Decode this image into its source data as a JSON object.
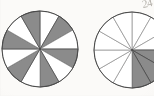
{
  "page": {
    "kind": "scanned-worksheet-fragment",
    "background_color": "#fbfaf8",
    "width": 154,
    "height": 96,
    "annotation_text": "24"
  },
  "palette": {
    "shaded_fill": "#8b8b8b",
    "unshaded_fill": "#ffffff",
    "stroke": "#4a4a4a",
    "light_stroke": "#8d8d8d",
    "paper": "#fbfaf8",
    "pencil": "#9a968f"
  },
  "chart_data": [
    {
      "type": "pie",
      "name": "left-fraction-circle",
      "title": "",
      "center_x": 40,
      "center_y": 49,
      "radius": 38,
      "slice_count": 12,
      "start_angle_deg": -90,
      "equal_slices": true,
      "slice_value": 1,
      "categories": [
        "1",
        "2",
        "3",
        "4",
        "5",
        "6",
        "7",
        "8",
        "9",
        "10",
        "11",
        "12"
      ],
      "values": [
        1,
        1,
        1,
        1,
        1,
        1,
        1,
        1,
        1,
        1,
        1,
        1
      ],
      "shaded": [
        false,
        true,
        false,
        true,
        false,
        true,
        false,
        true,
        false,
        true,
        false,
        true
      ],
      "shaded_count": 6,
      "total_count": 12,
      "fraction_label": "6/12",
      "legend": []
    },
    {
      "type": "pie",
      "name": "right-fraction-circle",
      "title": "",
      "center_x": 132,
      "center_y": 50,
      "radius": 38,
      "slice_count": 12,
      "start_angle_deg": -90,
      "equal_slices": true,
      "slice_value": 1,
      "categories": [
        "1",
        "2",
        "3",
        "4",
        "5",
        "6",
        "7",
        "8",
        "9",
        "10",
        "11",
        "12"
      ],
      "values": [
        1,
        1,
        1,
        1,
        1,
        1,
        1,
        1,
        1,
        1,
        1,
        1
      ],
      "shaded": [
        false,
        false,
        false,
        true,
        true,
        true,
        false,
        false,
        false,
        false,
        false,
        false
      ],
      "shaded_count": 3,
      "total_count": 12,
      "fraction_label": "3/12",
      "clipped_at_right_edge": true,
      "legend": []
    }
  ]
}
